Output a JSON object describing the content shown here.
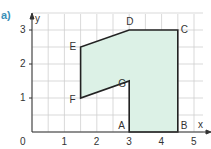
{
  "header": {
    "part_label": "a)",
    "cut_text": "… … … … … … … … … …"
  },
  "axes": {
    "x_label": "x",
    "y_label": "y",
    "origin_label": "0",
    "x_ticks": [
      "1",
      "2",
      "3",
      "4",
      "5"
    ],
    "y_ticks": [
      "1",
      "2",
      "3"
    ]
  },
  "shape": {
    "fill_color": "#dcf1e6",
    "stroke_color": "#222222",
    "grid_color": "#cfcfcf",
    "axis_color": "#333333",
    "vertices": [
      {
        "name": "A",
        "x": 3,
        "y": 0
      },
      {
        "name": "B",
        "x": 4.5,
        "y": 0
      },
      {
        "name": "C",
        "x": 4.5,
        "y": 3
      },
      {
        "name": "D",
        "x": 3,
        "y": 3
      },
      {
        "name": "E",
        "x": 1.5,
        "y": 2.5
      },
      {
        "name": "F",
        "x": 1.5,
        "y": 1
      },
      {
        "name": "G",
        "x": 3,
        "y": 1.5
      }
    ]
  }
}
